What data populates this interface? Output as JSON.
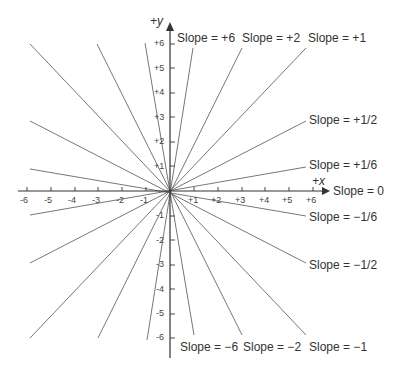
{
  "diagram": {
    "title": "",
    "x_axis_label": "+x",
    "y_axis_label": "+y",
    "x_ticks": [
      "-6",
      "-5",
      "-4",
      "-3",
      "-2",
      "-1",
      "+1",
      "+2",
      "+3",
      "+4",
      "+5",
      "+6"
    ],
    "y_ticks": [
      "+6",
      "+5",
      "+4",
      "+3",
      "+2",
      "+1",
      "-1",
      "-2",
      "-3",
      "-4",
      "-5",
      "-6"
    ],
    "slope_labels": {
      "pos6": "Slope = +6",
      "pos2": "Slope = +2",
      "pos1": "Slope = +1",
      "pos_half": "Slope = +1/2",
      "pos_sixth": "Slope = +1/6",
      "zero": "Slope = 0",
      "neg_sixth": "Slope = −1/6",
      "neg_half": "Slope = −1/2",
      "neg6": "Slope = −6",
      "neg2": "Slope = −2",
      "neg1": "Slope = −1"
    },
    "line_color": "#555555",
    "axis_color": "#333333"
  }
}
